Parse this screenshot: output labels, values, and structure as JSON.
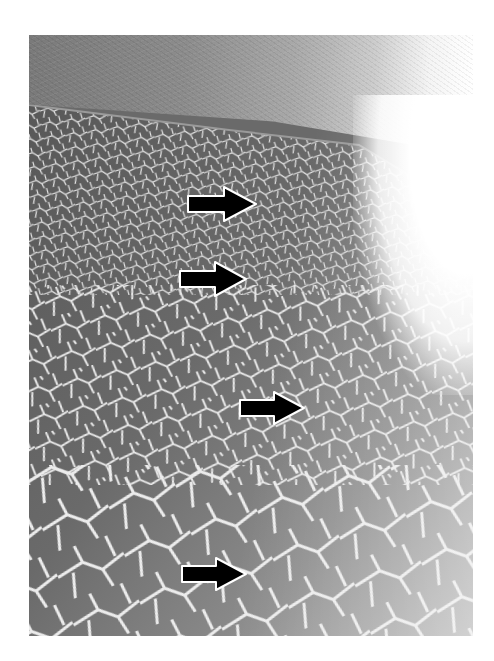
{
  "figure": {
    "palette": {
      "background": "#ffffff",
      "tile_dark": "#5e5e5e",
      "tile_light": "#b5b5b5",
      "grout": "#e6e6e6",
      "arrow_fill": "#000000",
      "arrow_outline": "#ffffff"
    },
    "arrows": [
      {
        "id": 1,
        "direction": "right",
        "x": 186,
        "y": 185,
        "width": 72,
        "height": 38
      },
      {
        "id": 2,
        "direction": "right",
        "x": 178,
        "y": 260,
        "width": 70,
        "height": 38
      },
      {
        "id": 3,
        "direction": "right",
        "x": 238,
        "y": 390,
        "width": 68,
        "height": 36
      },
      {
        "id": 4,
        "direction": "right",
        "x": 180,
        "y": 556,
        "width": 68,
        "height": 36
      }
    ]
  }
}
